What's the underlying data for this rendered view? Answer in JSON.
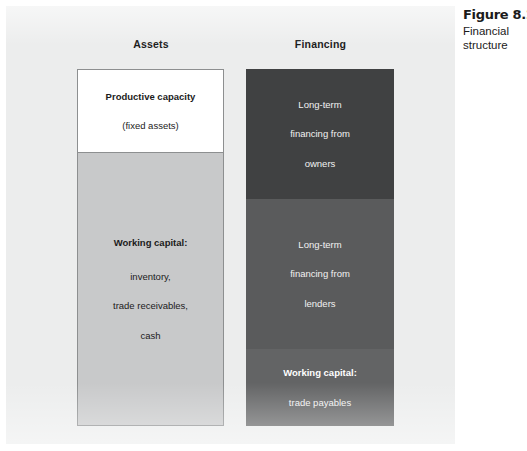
{
  "caption": {
    "title": "Figure 8.2",
    "subtitle": "Financial structure"
  },
  "columns": {
    "assets": {
      "header": "Assets",
      "blocks": [
        {
          "name": "productive-capacity",
          "fill": "#ffffff",
          "lines": [
            {
              "text": "Productive capacity",
              "bold": true
            },
            {
              "text": "(fixed assets)",
              "bold": false
            }
          ]
        },
        {
          "name": "working-capital-assets",
          "fill": "#c8c9ca",
          "lines": [
            {
              "text": "Working capital:",
              "bold": true
            },
            {
              "text": "inventory,",
              "bold": false
            },
            {
              "text": "trade receivables,",
              "bold": false
            },
            {
              "text": "cash",
              "bold": false
            }
          ]
        }
      ]
    },
    "financing": {
      "header": "Financing",
      "blocks": [
        {
          "name": "long-term-owners",
          "fill": "#404142",
          "lines": [
            {
              "text": "Long-term",
              "bold": false
            },
            {
              "text": "financing from",
              "bold": false
            },
            {
              "text": "owners",
              "bold": false
            }
          ]
        },
        {
          "name": "long-term-lenders",
          "fill": "#5a5b5c",
          "lines": [
            {
              "text": "Long-term",
              "bold": false
            },
            {
              "text": "financing from",
              "bold": false
            },
            {
              "text": "lenders",
              "bold": false
            }
          ]
        },
        {
          "name": "working-capital-financing",
          "fill": "#636465",
          "lines": [
            {
              "text": "Working capital:",
              "bold": true
            },
            {
              "text": "trade payables",
              "bold": false
            }
          ]
        }
      ]
    }
  }
}
